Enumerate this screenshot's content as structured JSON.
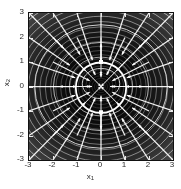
{
  "chart_data": {
    "type": "scatter",
    "title": "",
    "subtitle": "",
    "xlabel": "x1",
    "ylabel": "x2",
    "xlim": [
      -3,
      3
    ],
    "ylim": [
      -3,
      3
    ],
    "xticks": [
      "-3",
      "-2",
      "-1",
      "0",
      "1",
      "2",
      "3"
    ],
    "yticks": [
      "3",
      "2",
      "1",
      "0",
      "-1",
      "-2",
      "-3"
    ],
    "xtick_values": [
      -3,
      -2,
      -1,
      0,
      1,
      2,
      3
    ],
    "ytick_values": [
      3,
      2,
      1,
      0,
      -1,
      -2,
      -3
    ],
    "grid": false,
    "legend": "none",
    "background_color": "#0a0a0a",
    "arrow_color": "#ffffff",
    "contour_color": "#bfbfbf",
    "limit_cycle_color": "#ffffff",
    "annotations": [
      "vector field arrows point inward toward the limit cycle",
      "concentric closed contour level curves around origin",
      "bright white closed limit-cycle trajectory of radius about 1"
    ],
    "quiver": {
      "description": "7 by 7 grid of white arrows pointing toward the center attractor",
      "grid_x": [
        -3,
        -2,
        -1,
        0,
        1,
        2,
        3
      ],
      "grid_y": [
        -3,
        -2,
        -1,
        0,
        1,
        2,
        3
      ],
      "n_arrows": 49
    },
    "contours": {
      "description": "nested closed level sets, dark near origin and bright dense near the boundary",
      "n_levels": 26,
      "center": [
        0,
        0
      ]
    },
    "limit_cycle": {
      "center_x": 0.0,
      "center_y": -0.05,
      "radius": 1.05,
      "markers": [
        {
          "x": 0.0,
          "y": 1.0
        },
        {
          "x": 0.0,
          "y": -1.05
        }
      ]
    }
  },
  "axes": {
    "x_title": "x",
    "x_title_sub": "1",
    "y_title": "x",
    "y_title_sub": "2"
  }
}
